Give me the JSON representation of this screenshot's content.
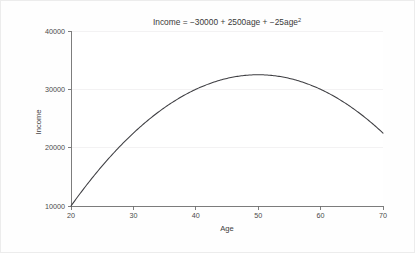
{
  "chart_data": {
    "type": "line",
    "title": "Income = −30000 + 2500age + −25age",
    "title_superscript": "2",
    "title_plain": "Income = -30000 + 2500age + -25age^2",
    "xlabel": "Age",
    "ylabel": "Income",
    "xlim": [
      20,
      70
    ],
    "ylim": [
      10000,
      40000
    ],
    "xticks": [
      20,
      30,
      40,
      50,
      60,
      70
    ],
    "xtick_labels": [
      "20",
      "30",
      "40",
      "50",
      "60",
      "70"
    ],
    "yticks": [
      10000,
      20000,
      30000,
      40000
    ],
    "ytick_labels": [
      "10000",
      "20000",
      "30000",
      "40000"
    ],
    "grid": "horizontal",
    "legend": "none",
    "equation": {
      "intercept": -30000,
      "linear_coefficient": 2500,
      "quadratic_coefficient": -25,
      "variable": "age"
    },
    "vertex": {
      "x": 50,
      "y": 32500
    },
    "series": [
      {
        "name": "Income",
        "color": "#3e3e42",
        "x": [
          20,
          22,
          24,
          26,
          28,
          30,
          32,
          34,
          36,
          38,
          40,
          42,
          44,
          46,
          48,
          50,
          52,
          54,
          56,
          58,
          60,
          62,
          64,
          66,
          68,
          70
        ],
        "values": [
          10000,
          12900,
          15600,
          18100,
          20400,
          22500,
          24400,
          26100,
          27600,
          28900,
          30000,
          30900,
          31600,
          32100,
          32400,
          32500,
          32400,
          32100,
          31600,
          30900,
          30000,
          28900,
          27600,
          26100,
          24400,
          22500
        ]
      }
    ]
  },
  "figure": {
    "background_color": "#fefefe",
    "plot_background_color": "#ffffff",
    "axis_color": "#6f6f6f",
    "grid_color": "#f0eff0",
    "curve_color": "#3e3e42",
    "text_color": "#3a3a3a"
  }
}
